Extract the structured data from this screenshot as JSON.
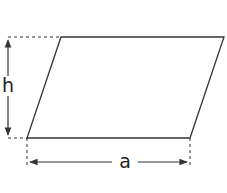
{
  "diagram": {
    "shape": "parallelogram",
    "colors": {
      "stroke": "#333333",
      "background": "#ffffff"
    },
    "vertices": {
      "top_left": [
        61,
        37
      ],
      "top_right": [
        224,
        37
      ],
      "bottom_right": [
        190,
        138
      ],
      "bottom_left": [
        27,
        138
      ]
    },
    "labels": {
      "height": "h",
      "base": "a"
    }
  }
}
